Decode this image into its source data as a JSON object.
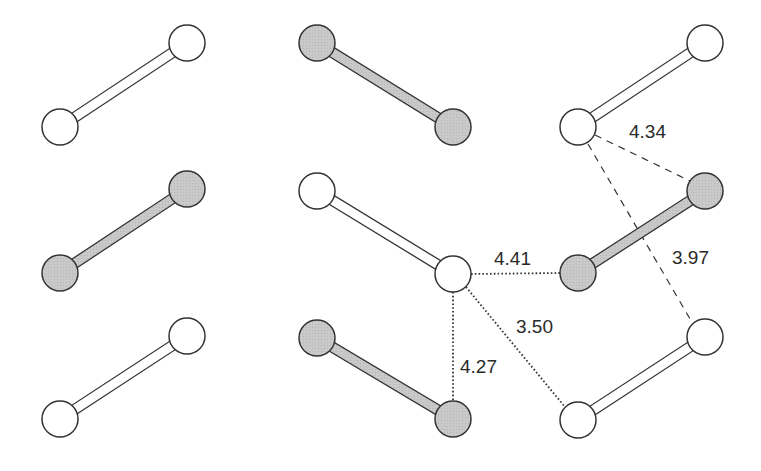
{
  "diagram": {
    "type": "molecular-packing",
    "colors": {
      "stroke": "#333333",
      "open_fill": "#ffffff",
      "shaded_fill": "#c8c8c8",
      "background": "#ffffff"
    },
    "atom_radius": 18,
    "molecules": [
      {
        "id": "m1",
        "shaded": false,
        "a": [
          60,
          127
        ],
        "b": [
          187,
          43
        ]
      },
      {
        "id": "m2",
        "shaded": true,
        "a": [
          60,
          273
        ],
        "b": [
          187,
          189
        ]
      },
      {
        "id": "m3",
        "shaded": false,
        "a": [
          60,
          419
        ],
        "b": [
          187,
          336
        ]
      },
      {
        "id": "m4",
        "shaded": true,
        "a": [
          317,
          43
        ],
        "b": [
          453,
          127
        ]
      },
      {
        "id": "m5",
        "shaded": false,
        "a": [
          317,
          191
        ],
        "b": [
          453,
          274
        ]
      },
      {
        "id": "m6",
        "shaded": true,
        "a": [
          317,
          338
        ],
        "b": [
          453,
          419
        ]
      },
      {
        "id": "m7",
        "shaded": false,
        "a": [
          578,
          127
        ],
        "b": [
          705,
          43
        ]
      },
      {
        "id": "m8",
        "shaded": true,
        "a": [
          578,
          273
        ],
        "b": [
          705,
          191
        ]
      },
      {
        "id": "m9",
        "shaded": false,
        "a": [
          578,
          420
        ],
        "b": [
          705,
          337
        ]
      }
    ],
    "contacts": [
      {
        "label": "4.41",
        "style": "dotted",
        "from": [
          471,
          274
        ],
        "to": [
          560,
          273
        ],
        "label_pos": [
          494,
          265
        ]
      },
      {
        "label": "4.27",
        "style": "dotted",
        "from": [
          453,
          292
        ],
        "to": [
          453,
          412
        ],
        "label_pos": [
          460,
          373
        ]
      },
      {
        "label": "3.50",
        "style": "dotted",
        "from": [
          466,
          287
        ],
        "to": [
          565,
          407
        ],
        "label_pos": [
          516,
          333
        ]
      },
      {
        "label": "4.34",
        "style": "dashed",
        "from": [
          595,
          135
        ],
        "to": [
          690,
          181
        ],
        "label_pos": [
          629,
          138
        ]
      },
      {
        "label": "3.97",
        "style": "dashed",
        "from": [
          588,
          144
        ],
        "to": [
          693,
          324
        ],
        "label_pos": [
          672,
          264
        ]
      }
    ]
  }
}
